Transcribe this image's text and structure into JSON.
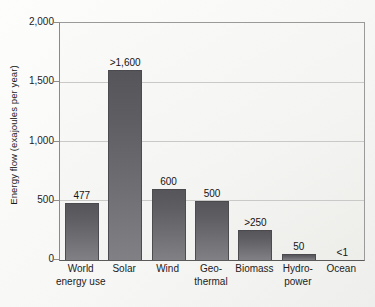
{
  "chart_data": {
    "type": "bar",
    "title": "",
    "subtitle": "",
    "xlabel": "",
    "ylabel": "Energy flow (exajoules per year)",
    "categories": [
      "World\nenergy use",
      "Solar",
      "Wind",
      "Geo-\nthermal",
      "Biomass",
      "Hydro-\npower",
      "Ocean"
    ],
    "values": [
      477,
      1600,
      600,
      500,
      250,
      50,
      1
    ],
    "value_labels": [
      "477",
      ">1,600",
      "600",
      "500",
      ">250",
      "50",
      "<1"
    ],
    "ylim": [
      0,
      2000
    ],
    "ytick_values": [
      0,
      500,
      1000,
      1500,
      2000
    ],
    "ytick_labels": [
      "0",
      "500",
      "1,000",
      "1,500",
      "2,000"
    ],
    "grid": true,
    "grid_axis": "y",
    "legend": false,
    "legend_position": "none",
    "bar_color": "#6a6a6e",
    "plot_background": "#f5f5f3",
    "gridline_color": "#c9c9c7",
    "axis_color": "#5a5a5a",
    "text_color": "#1c1c1c"
  }
}
